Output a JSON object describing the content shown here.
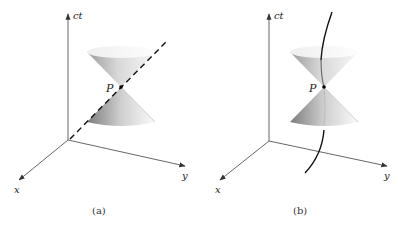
{
  "figure": {
    "panels": [
      {
        "id": "a",
        "caption": "(a)",
        "axes": {
          "time": "ct",
          "x": "x",
          "y": "y"
        },
        "event_label": "P",
        "worldline": "dashed straight line (light-like)"
      },
      {
        "id": "b",
        "caption": "(b)",
        "axes": {
          "time": "ct",
          "x": "x",
          "y": "y"
        },
        "event_label": "P",
        "worldline": "solid curved line (time-like)"
      }
    ],
    "colors": {
      "axis": "#555555",
      "worldline": "#111111",
      "cone_dark": "#8a8a8a",
      "cone_light": "#f4f4f4"
    }
  }
}
